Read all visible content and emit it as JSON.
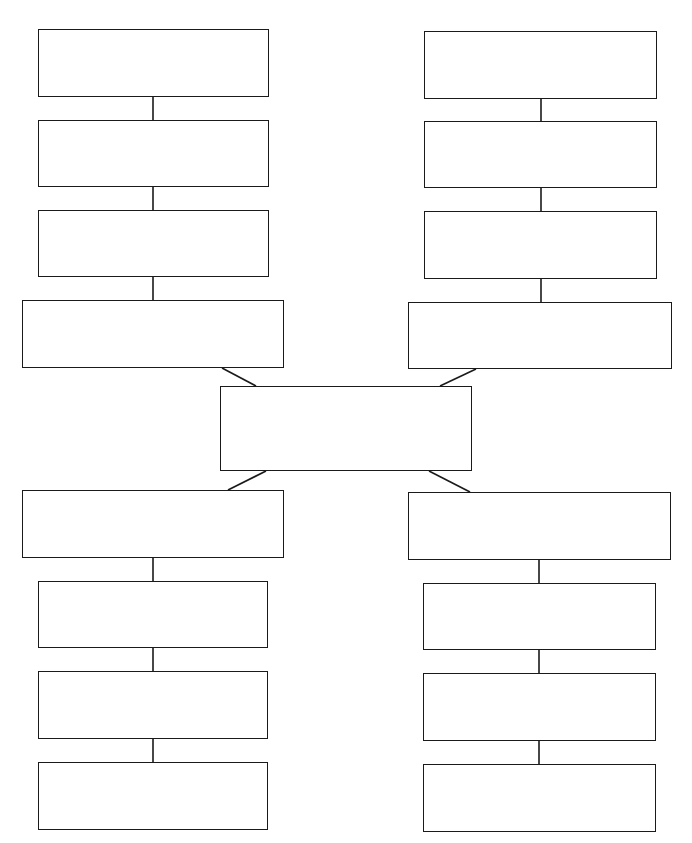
{
  "diagram": {
    "type": "graphic-organizer",
    "stroke_color": "#1a1a1a",
    "background": "#ffffff",
    "center": {
      "id": "center",
      "label": "",
      "box": [
        220,
        386,
        252,
        85
      ]
    },
    "branches": [
      {
        "name": "top-left",
        "boxes": [
          {
            "label": "",
            "box": [
              38,
              29,
              231,
              68
            ]
          },
          {
            "label": "",
            "box": [
              38,
              120,
              231,
              67
            ]
          },
          {
            "label": "",
            "box": [
              38,
              210,
              231,
              67
            ]
          },
          {
            "label": "",
            "box": [
              22,
              300,
              262,
              68
            ]
          }
        ]
      },
      {
        "name": "top-right",
        "boxes": [
          {
            "label": "",
            "box": [
              424,
              31,
              233,
              68
            ]
          },
          {
            "label": "",
            "box": [
              424,
              121,
              233,
              67
            ]
          },
          {
            "label": "",
            "box": [
              424,
              211,
              233,
              68
            ]
          },
          {
            "label": "",
            "box": [
              408,
              302,
              264,
              67
            ]
          }
        ]
      },
      {
        "name": "bottom-left",
        "boxes": [
          {
            "label": "",
            "box": [
              22,
              490,
              262,
              68
            ]
          },
          {
            "label": "",
            "box": [
              38,
              581,
              230,
              67
            ]
          },
          {
            "label": "",
            "box": [
              38,
              671,
              230,
              68
            ]
          },
          {
            "label": "",
            "box": [
              38,
              762,
              230,
              68
            ]
          }
        ]
      },
      {
        "name": "bottom-right",
        "boxes": [
          {
            "label": "",
            "box": [
              408,
              492,
              263,
              68
            ]
          },
          {
            "label": "",
            "box": [
              423,
              583,
              233,
              67
            ]
          },
          {
            "label": "",
            "box": [
              423,
              673,
              233,
              68
            ]
          },
          {
            "label": "",
            "box": [
              423,
              764,
              233,
              68
            ]
          }
        ]
      }
    ],
    "connectors": [
      {
        "from": "top-left-1",
        "to": "top-left-2",
        "line": [
          153,
          97,
          153,
          120
        ]
      },
      {
        "from": "top-left-2",
        "to": "top-left-3",
        "line": [
          153,
          187,
          153,
          210
        ]
      },
      {
        "from": "top-left-3",
        "to": "top-left-4",
        "line": [
          153,
          277,
          153,
          300
        ]
      },
      {
        "from": "top-right-1",
        "to": "top-right-2",
        "line": [
          541,
          99,
          541,
          121
        ]
      },
      {
        "from": "top-right-2",
        "to": "top-right-3",
        "line": [
          541,
          188,
          541,
          211
        ]
      },
      {
        "from": "top-right-3",
        "to": "top-right-4",
        "line": [
          541,
          279,
          541,
          302
        ]
      },
      {
        "from": "bottom-left-1",
        "to": "bottom-left-2",
        "line": [
          153,
          558,
          153,
          581
        ]
      },
      {
        "from": "bottom-left-2",
        "to": "bottom-left-3",
        "line": [
          153,
          648,
          153,
          671
        ]
      },
      {
        "from": "bottom-left-3",
        "to": "bottom-left-4",
        "line": [
          153,
          739,
          153,
          762
        ]
      },
      {
        "from": "bottom-right-1",
        "to": "bottom-right-2",
        "line": [
          539,
          560,
          539,
          583
        ]
      },
      {
        "from": "bottom-right-2",
        "to": "bottom-right-3",
        "line": [
          539,
          650,
          539,
          673
        ]
      },
      {
        "from": "bottom-right-3",
        "to": "bottom-right-4",
        "line": [
          539,
          741,
          539,
          764
        ]
      },
      {
        "from": "top-left-4",
        "to": "center",
        "line": [
          222,
          368,
          256,
          386
        ]
      },
      {
        "from": "top-right-4",
        "to": "center",
        "line": [
          476,
          369,
          440,
          386
        ]
      },
      {
        "from": "center",
        "to": "bottom-left-1",
        "line": [
          266,
          471,
          228,
          490
        ]
      },
      {
        "from": "center",
        "to": "bottom-right-1",
        "line": [
          429,
          471,
          470,
          492
        ]
      }
    ]
  }
}
